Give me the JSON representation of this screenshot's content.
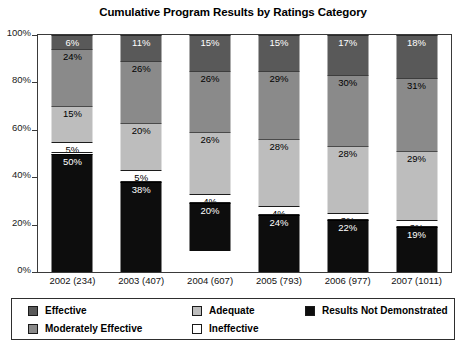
{
  "chart_data": {
    "type": "bar",
    "title": "Cumulative Program Results by Ratings Category",
    "xlabel": "",
    "ylabel": "",
    "ylim": [
      0,
      100
    ],
    "grid": false,
    "stacked": true,
    "legend_position": "bottom",
    "ytick_labels": [
      "100%",
      "80%",
      "60%",
      "40%",
      "20%",
      "0%"
    ],
    "ytick_values": [
      100,
      80,
      60,
      40,
      20,
      0
    ],
    "categories": [
      "2002 (234)",
      "2003 (407)",
      "2004 (607)",
      "2005 (793)",
      "2006 (977)",
      "2007 (1011)"
    ],
    "series": [
      {
        "name": "Effective",
        "color": "#595959",
        "values": [
          6,
          11,
          15,
          15,
          17,
          18
        ],
        "labels": [
          "6%",
          "11%",
          "15%",
          "15%",
          "17%",
          "18%"
        ]
      },
      {
        "name": "Moderately Effective",
        "color": "#8a8a8a",
        "values": [
          24,
          26,
          26,
          29,
          30,
          31
        ],
        "labels": [
          "24%",
          "26%",
          "26%",
          "29%",
          "30%",
          "31%"
        ]
      },
      {
        "name": "Adequate",
        "color": "#bdbdbd",
        "values": [
          15,
          20,
          26,
          28,
          28,
          29
        ],
        "labels": [
          "15%",
          "20%",
          "26%",
          "28%",
          "28%",
          "29%"
        ]
      },
      {
        "name": "Ineffective",
        "color": "#ffffff",
        "values": [
          5,
          5,
          4,
          4,
          3,
          3
        ],
        "labels": [
          "5%",
          "5%",
          "4%",
          "4%",
          "3%",
          "3%"
        ]
      },
      {
        "name": "Results Not Demonstrated",
        "color": "#0d0d0d",
        "values": [
          50,
          38,
          20,
          24,
          22,
          19
        ],
        "labels": [
          "50%",
          "38%",
          "20%",
          "24%",
          "22%",
          "19%"
        ]
      }
    ]
  },
  "legend": {
    "entries": [
      {
        "label": "Effective",
        "swatch": "effective"
      },
      {
        "label": "Adequate",
        "swatch": "adequate"
      },
      {
        "label": "Results Not Demonstrated",
        "swatch": "notdemo"
      },
      {
        "label": "Moderately Effective",
        "swatch": "moderate"
      },
      {
        "label": "Ineffective",
        "swatch": "ineffective"
      }
    ]
  }
}
